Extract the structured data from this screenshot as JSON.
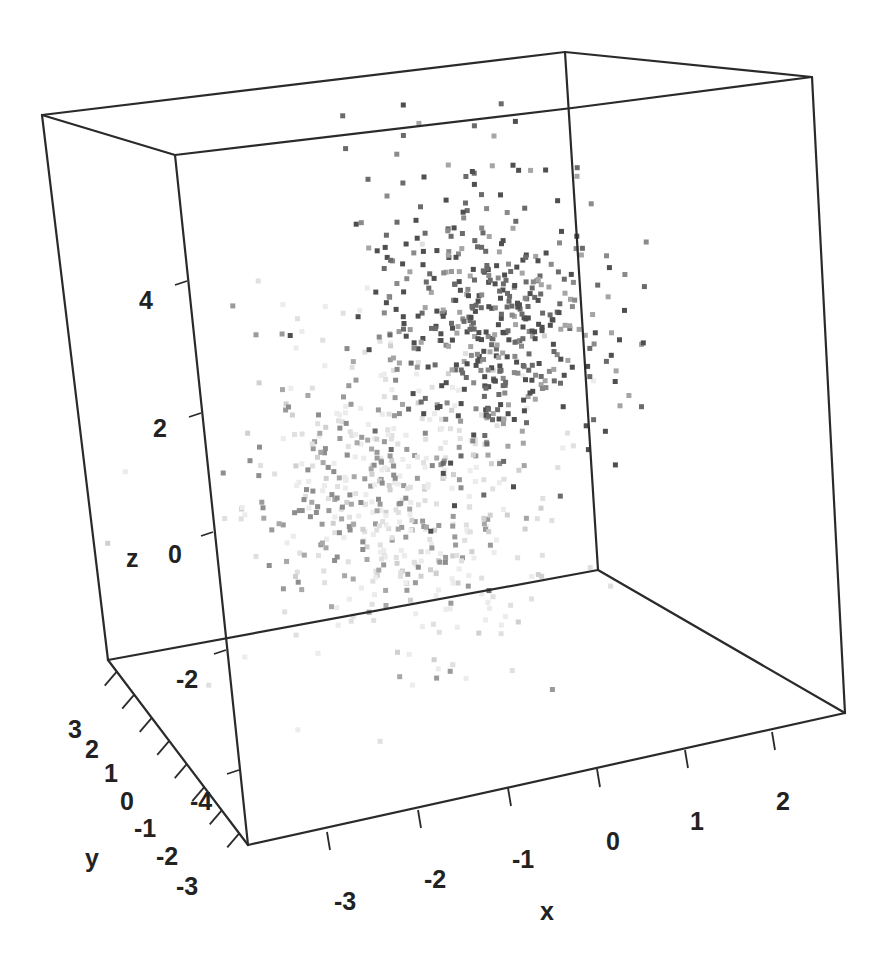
{
  "chart_data": {
    "type": "scatter",
    "subtype": "3d-scatter",
    "title": "",
    "xlabel": "x",
    "ylabel": "y",
    "zlabel": "z",
    "x_ticks": [
      "-3",
      "-2",
      "-1",
      "0",
      "1",
      "2"
    ],
    "y_ticks": [
      "3",
      "2",
      "1",
      "0",
      "-1",
      "-2",
      "-3"
    ],
    "z_ticks": [
      "4",
      "2",
      "0",
      "-2",
      "-4"
    ],
    "xlim": [
      -3.5,
      3
    ],
    "ylim": [
      -3.5,
      3.5
    ],
    "zlim": [
      -5,
      6
    ],
    "grid": false,
    "legend": null,
    "marker": "square",
    "color_scale": "grayscale by depth/group",
    "series": [
      {
        "name": "cluster-1 (dark, upper)",
        "n": 500,
        "center": {
          "x": 1.0,
          "y": 0.5,
          "z": 3.5
        },
        "spread": {
          "x": 1.0,
          "y": 1.0,
          "z": 1.0
        },
        "colors": [
          "#555555",
          "#6a6a6a",
          "#7d7d7d",
          "#929292",
          "#a6a6a6"
        ]
      },
      {
        "name": "cluster-2 (light, lower)",
        "n": 500,
        "center": {
          "x": -1.0,
          "y": -0.5,
          "z": 0.5
        },
        "spread": {
          "x": 1.0,
          "y": 1.0,
          "z": 1.0
        },
        "colors": [
          "#e8e8e8",
          "#dedede",
          "#d2d2d2",
          "#a0a0a0",
          "#8c8c8c"
        ]
      }
    ]
  },
  "render": {
    "box": {
      "tbl": [
        42,
        115
      ],
      "tbm": [
        565,
        52
      ],
      "tr": [
        812,
        77
      ],
      "tfl": [
        175,
        155
      ],
      "tfm": [
        572,
        108
      ],
      "bbl": [
        108,
        660
      ],
      "bbm": [
        598,
        570
      ],
      "br": [
        845,
        713
      ],
      "bfl": [
        248,
        845
      ]
    },
    "clusters_px": [
      {
        "cx": 492,
        "cy": 320,
        "sx": 62,
        "sy": 72,
        "rot": -0.35,
        "n": 470,
        "palette": [
          [
            "#4f4f4f",
            0.35
          ],
          [
            "#6b6b6b",
            0.3
          ],
          [
            "#8a8a8a",
            0.2
          ],
          [
            "#a5a5a5",
            0.15
          ]
        ]
      },
      {
        "cx": 395,
        "cy": 500,
        "sx": 70,
        "sy": 85,
        "rot": -0.4,
        "n": 430,
        "palette": [
          [
            "#ececec",
            0.35
          ],
          [
            "#e0e0e0",
            0.3
          ],
          [
            "#d0d0d0",
            0.15
          ],
          [
            "#9a9a9a",
            0.2
          ]
        ]
      },
      {
        "cx": 330,
        "cy": 500,
        "sx": 55,
        "sy": 60,
        "rot": -0.3,
        "n": 90,
        "palette": [
          [
            "#8e8e8e",
            0.6
          ],
          [
            "#a8a8a8",
            0.4
          ]
        ]
      }
    ]
  },
  "labels": {
    "x": "x",
    "y": "y",
    "z": "z"
  }
}
